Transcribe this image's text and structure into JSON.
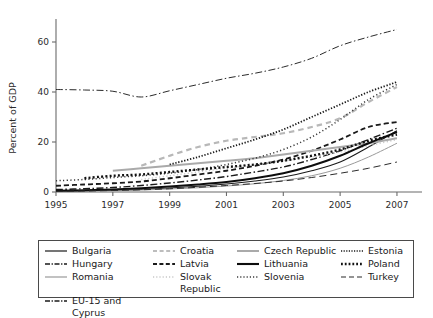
{
  "chart_data": {
    "type": "line",
    "title": "",
    "xlabel": "",
    "ylabel": "Percent of GDP",
    "xlim": [
      1995,
      2007.6
    ],
    "ylim": [
      -4,
      68
    ],
    "xticks": [
      "1995",
      "1997",
      "1999",
      "2001",
      "2003",
      "2005",
      "2007"
    ],
    "xtick_values": [
      1995,
      1997,
      1999,
      2001,
      2003,
      2005,
      2007
    ],
    "yticks": [
      "0",
      "20",
      "40",
      "60"
    ],
    "ytick_values": [
      0,
      20,
      40,
      60
    ],
    "grid": false,
    "legend_position": "below-plot",
    "x": [
      1995,
      1996,
      1997,
      1998,
      1999,
      2000,
      2001,
      2002,
      2003,
      2004,
      2005,
      2006,
      2007
    ],
    "series": [
      {
        "name": "Bulgaria",
        "style": "solid",
        "color": "#1a1a1a",
        "width": 1.1,
        "values": [
          0.4,
          0.5,
          0.7,
          1.0,
          1.6,
          2.3,
          3.2,
          4.4,
          6.0,
          8.5,
          12.0,
          18.0,
          24.5
        ]
      },
      {
        "name": "Hungary",
        "style": "dashdot",
        "color": "#1a1a1a",
        "width": 1.4,
        "values": [
          1.0,
          1.3,
          1.8,
          2.6,
          3.6,
          4.8,
          6.2,
          8.0,
          10.0,
          13.0,
          16.5,
          21.0,
          25.5
        ]
      },
      {
        "name": "Romania",
        "style": "solid",
        "color": "#9a9a9a",
        "width": 1.0,
        "values": [
          0.3,
          0.4,
          0.5,
          0.8,
          1.2,
          1.7,
          2.4,
          3.3,
          4.6,
          6.5,
          9.5,
          14.0,
          19.5
        ]
      },
      {
        "name": "EU-15 and Cyprus",
        "style": "dashdot",
        "color": "#2b2b2b",
        "width": 1.0,
        "values": [
          41.0,
          40.8,
          40.3,
          38.0,
          40.5,
          43.0,
          45.5,
          47.5,
          50.0,
          53.5,
          58.5,
          62.0,
          65.0
        ]
      },
      {
        "name": "Croatia",
        "style": "dashed-wide",
        "color": "#b8b8b8",
        "width": 2.2,
        "values": [
          null,
          null,
          null,
          10.5,
          14.5,
          18.0,
          20.5,
          22.0,
          23.5,
          26.0,
          29.5,
          36.0,
          42.0
        ]
      },
      {
        "name": "Latvia",
        "style": "dashed",
        "color": "#1a1a1a",
        "width": 1.8,
        "values": [
          2.5,
          3.0,
          3.5,
          4.2,
          5.5,
          7.0,
          8.5,
          10.5,
          13.0,
          16.5,
          21.0,
          26.0,
          28.0
        ]
      },
      {
        "name": "Slovak Republic",
        "style": "dotted",
        "color": "#c8c8c8",
        "width": 1.4,
        "values": [
          null,
          null,
          null,
          5.0,
          6.5,
          8.0,
          9.5,
          11.0,
          12.5,
          14.0,
          16.0,
          18.5,
          21.0
        ]
      },
      {
        "name": "Czech Republic",
        "style": "solid",
        "color": "#aaaaaa",
        "width": 2.0,
        "values": [
          null,
          null,
          8.5,
          9.5,
          10.5,
          11.5,
          12.5,
          13.5,
          15.0,
          16.5,
          18.0,
          19.5,
          21.5
        ]
      },
      {
        "name": "Lithuania",
        "style": "solid",
        "color": "#0d0d0d",
        "width": 1.9,
        "values": [
          0.5,
          0.7,
          1.0,
          1.5,
          2.2,
          3.0,
          4.0,
          5.5,
          7.5,
          10.5,
          14.5,
          19.5,
          24.0
        ]
      },
      {
        "name": "Slovenia",
        "style": "dotted",
        "color": "#3a3a3a",
        "width": 1.5,
        "values": [
          4.5,
          5.0,
          5.8,
          6.5,
          7.5,
          9.0,
          11.0,
          13.5,
          17.0,
          22.0,
          29.0,
          37.0,
          43.0
        ]
      },
      {
        "name": "Estonia",
        "style": "densely-dotted",
        "color": "#1a1a1a",
        "width": 1.8,
        "values": [
          null,
          null,
          null,
          null,
          11.0,
          14.0,
          17.5,
          21.0,
          25.0,
          30.0,
          35.0,
          40.0,
          44.0
        ]
      },
      {
        "name": "Poland",
        "style": "dotted-thick",
        "color": "#111111",
        "width": 2.4,
        "values": [
          null,
          5.5,
          6.5,
          7.0,
          8.0,
          9.0,
          10.0,
          11.0,
          12.5,
          14.5,
          17.0,
          20.5,
          23.0
        ]
      },
      {
        "name": "Turkey",
        "style": "long-dashed",
        "color": "#2b2b2b",
        "width": 1.0,
        "values": [
          0.3,
          0.4,
          0.6,
          0.9,
          1.3,
          1.9,
          2.6,
          3.4,
          4.4,
          5.8,
          7.5,
          9.5,
          12.0
        ]
      }
    ]
  },
  "legend": {
    "columns": [
      [
        {
          "label": "Bulgaria",
          "sample": "solid-thin-black"
        },
        {
          "label": "Hungary",
          "sample": "dashdot-black"
        },
        {
          "label": "Romania",
          "sample": "solid-gray"
        },
        {
          "label": "EU-15 and Cyprus",
          "sample": "dashdot-black"
        }
      ],
      [
        {
          "label": "Croatia",
          "sample": "dashed-lightgray"
        },
        {
          "label": "Latvia",
          "sample": "dashed-black"
        },
        {
          "label": "Slovak\nRepublic",
          "sample": "dotted-lightgray"
        }
      ],
      [
        {
          "label": "Czech Republic",
          "sample": "solid-gray-thick"
        },
        {
          "label": "Lithuania",
          "sample": "solid-black-thick"
        },
        {
          "label": "Slovenia",
          "sample": "dotted-black"
        }
      ],
      [
        {
          "label": "Estonia",
          "sample": "densely-dotted-black"
        },
        {
          "label": "Poland",
          "sample": "dotted-thick-black"
        },
        {
          "label": "Turkey",
          "sample": "long-dashed-black"
        }
      ]
    ]
  },
  "colors": {
    "axis": "#6b6b6b",
    "text": "#1a1a1a",
    "legend_border": "#4a4a4a",
    "background": "#ffffff"
  }
}
